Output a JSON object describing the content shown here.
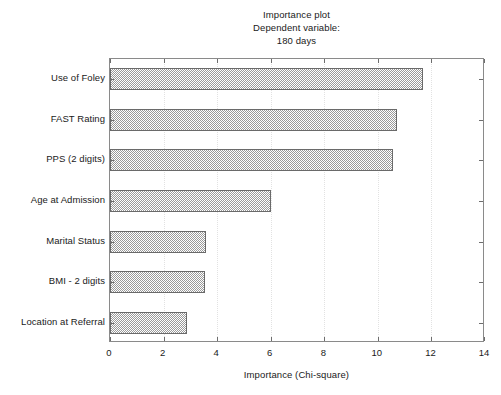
{
  "chart_data": {
    "type": "bar",
    "orientation": "horizontal",
    "title": "Importance plot",
    "subtitle": "Dependent variable:",
    "subtitle2": "180 days",
    "title_lines": [
      "Importance plot",
      "Dependent variable:",
      "180 days"
    ],
    "xlabel": "Importance (Chi-square)",
    "ylabel": "",
    "categories": [
      "Use of Foley",
      "FAST Rating",
      "PPS (2 digits)",
      "Age at Admission",
      "Marital Status",
      "BMI - 2 digits",
      "Location at Referral"
    ],
    "values": [
      11.7,
      10.7,
      10.55,
      6.0,
      3.6,
      3.55,
      2.87
    ],
    "xlim": [
      0,
      14
    ],
    "xticks": [
      0,
      2,
      4,
      6,
      8,
      10,
      12,
      14
    ],
    "xtick_labels": [
      "0",
      "2",
      "4",
      "6",
      "8",
      "10",
      "12",
      "14"
    ],
    "grid": true,
    "grid_axis": "x",
    "grid_style": "dotted",
    "legend": false,
    "bar_fill_pattern": "checkerboard-hatch",
    "bar_fill_color": "#9a9a9a",
    "bar_border_color": "#6a6a6a",
    "axis_color": "#8a8a8a",
    "background_color": "#ffffff",
    "text_color": "#1a1a1a"
  }
}
